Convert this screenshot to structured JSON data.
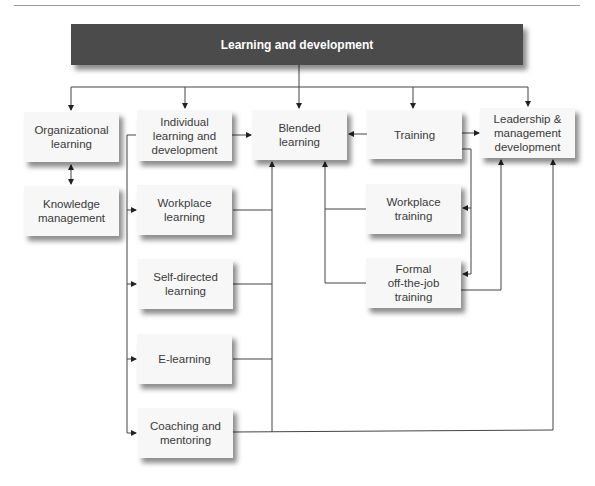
{
  "diagram": {
    "title": "Learning and development",
    "nodes": {
      "organizational": "Organizational\nlearning",
      "knowledge": "Knowledge\nmanagement",
      "individual": "Individual\nlearning and\ndevelopment",
      "workplace_learning": "Workplace\nlearning",
      "self_directed": "Self-directed\nlearning",
      "elearning": "E-learning",
      "coaching": "Coaching and\nmentoring",
      "blended": "Blended\nlearning",
      "training": "Training",
      "workplace_training": "Workplace\ntraining",
      "formal": "Formal\noff-the-job\ntraining",
      "leadership": "Leadership &\nmanagement\ndevelopment"
    },
    "edges": [
      {
        "from": "Learning and development",
        "to": "Organizational learning"
      },
      {
        "from": "Learning and development",
        "to": "Individual learning and development"
      },
      {
        "from": "Learning and development",
        "to": "Blended learning"
      },
      {
        "from": "Learning and development",
        "to": "Training"
      },
      {
        "from": "Learning and development",
        "to": "Leadership & management development"
      },
      {
        "from": "Organizational learning",
        "to": "Knowledge management",
        "bidirectional": true
      },
      {
        "from": "Individual learning and development",
        "to": "Blended learning"
      },
      {
        "from": "Individual learning and development",
        "to": "Workplace learning"
      },
      {
        "from": "Individual learning and development",
        "to": "Self-directed learning"
      },
      {
        "from": "Individual learning and development",
        "to": "E-learning"
      },
      {
        "from": "Individual learning and development",
        "to": "Coaching and mentoring"
      },
      {
        "from": "Workplace learning",
        "to": "Blended learning"
      },
      {
        "from": "Self-directed learning",
        "to": "Blended learning"
      },
      {
        "from": "E-learning",
        "to": "Blended learning"
      },
      {
        "from": "Coaching and mentoring",
        "to": "Blended learning"
      },
      {
        "from": "Coaching and mentoring",
        "to": "Leadership & management development"
      },
      {
        "from": "Training",
        "to": "Blended learning"
      },
      {
        "from": "Training",
        "to": "Leadership & management development"
      },
      {
        "from": "Training",
        "to": "Workplace training"
      },
      {
        "from": "Training",
        "to": "Formal off-the-job training"
      },
      {
        "from": "Workplace training",
        "to": "Blended learning"
      },
      {
        "from": "Formal off-the-job training",
        "to": "Blended learning"
      },
      {
        "from": "Formal off-the-job training",
        "to": "Leadership & management development"
      }
    ]
  }
}
